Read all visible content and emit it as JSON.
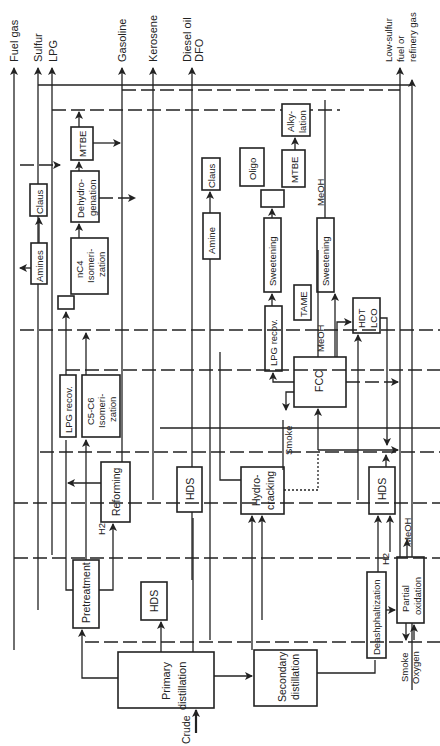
{
  "diagram": {
    "orientation": "rotated 90 degrees counter-clockwise",
    "products": {
      "fuel_gas": "Fuel gas",
      "sulfur": "Sulfur",
      "lpg": "LPG",
      "gasoline": "Gasoline",
      "kerosene": "Kerosene",
      "diesel_oil": "Diesel oil",
      "dfo": "DFO",
      "low_sulfur_1": "Low-sulfur",
      "low_sulfur_2": "fuel or",
      "low_sulfur_3": "refinery gas"
    },
    "units": {
      "primary_distillation_1": "Primary",
      "primary_distillation_2": "distillation",
      "secondary_distillation_1": "Secondary",
      "secondary_distillation_2": "distillation",
      "pretreatment": "Pretreatment",
      "hds_1": "HDS",
      "hds_2": "HDS",
      "hds_3": "HDS",
      "reforming": "Reforming",
      "lpg_recov_1": "LPG recov.",
      "lpg_recov_2": "LPG recov.",
      "c5c6_iso_1": "C5-C6",
      "c5c6_iso_2": "Isomeri-",
      "c5c6_iso_3": "zation",
      "nc4_iso_1": "nC4",
      "nc4_iso_2": "Isomeri-",
      "nc4_iso_3": "zation",
      "dehydro_1": "Dehydro-",
      "dehydro_2": "genation",
      "mtbe_1": "MTBE",
      "mtbe_2": "MTBE",
      "amines": "Amines",
      "amine": "Amine",
      "claus_1": "Claus",
      "claus_2": "Claus",
      "hydrocracking_1": "Hydro-",
      "hydrocracking_2": "cracking",
      "oligo": "Oligo",
      "sweetening_1": "Sweetening",
      "sweetening_2": "Sweetening",
      "alkylation_1": "Alky-",
      "alkylation_2": "lation",
      "fcc": "FCC",
      "tame": "TAME",
      "hdt_lco_1": "HDT",
      "hdt_lco_2": "LCO",
      "deasphaltization": "Deashphaltization",
      "partial_oxidation_1": "Partial",
      "partial_oxidation_2": "oxidation"
    },
    "streams": {
      "crude": "Crude",
      "h2_1": "H2",
      "h2_2": "H2",
      "meoh_1": "MeOH",
      "meoh_2": "MeOH",
      "meoh_3": "MeOH",
      "smoke_1": "Smoke",
      "smoke_2": "Smoke",
      "oxygen": "Oxygen"
    }
  }
}
